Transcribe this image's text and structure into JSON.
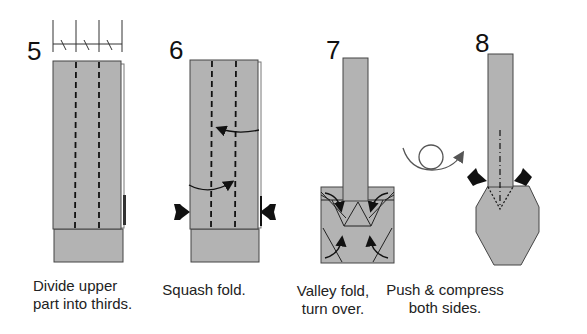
{
  "colors": {
    "paper": "#b3b3b3",
    "paper_light": "#c4c4c4",
    "outline": "#555555",
    "line": "#111111",
    "background": "#ffffff"
  },
  "steps": [
    {
      "number": "5",
      "caption": "Divide upper\npart into thirds.",
      "icons": [
        "ruler-thirds-icon",
        "valley-fold-lines"
      ]
    },
    {
      "number": "6",
      "caption": "Squash fold.",
      "icons": [
        "fold-arrow-icon",
        "push-arrow-icon"
      ]
    },
    {
      "number": "7",
      "caption": "Valley fold,\nturn over.",
      "icons": [
        "fold-arrow-icon"
      ]
    },
    {
      "number": "8",
      "caption": "Push & compress\nboth sides.",
      "icons": [
        "turn-over-icon",
        "push-arrow-icon",
        "mountain-fold-line"
      ]
    }
  ]
}
